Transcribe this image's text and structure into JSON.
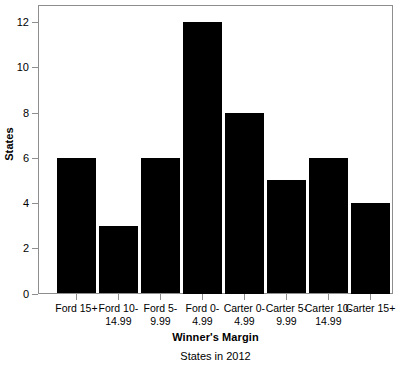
{
  "chart_data": {
    "type": "bar",
    "title": "",
    "subtitle": "States in 2012",
    "xlabel": "Winner's Margin",
    "ylabel": "States",
    "categories": [
      "Ford 15+",
      "Ford 10-14.99",
      "Ford 5-9.99",
      "Ford 0-4.99",
      "Carter 0-4.99",
      "Carter 5-9.99",
      "Carter 10-14.99",
      "Carter 15+"
    ],
    "category_lines": [
      [
        "Ford 15+"
      ],
      [
        "Ford 10-",
        "14.99"
      ],
      [
        "Ford 5-",
        "9.99"
      ],
      [
        "Ford 0-",
        "4.99"
      ],
      [
        "Carter 0-",
        "4.99"
      ],
      [
        "Carter 5-",
        "9.99"
      ],
      [
        "Carter 10-",
        "14.99"
      ],
      [
        "Carter 15+"
      ]
    ],
    "values": [
      6,
      3,
      6,
      12,
      8,
      5,
      6,
      4
    ],
    "ylim": [
      0,
      12.75
    ],
    "yticks": [
      0,
      2,
      4,
      6,
      8,
      10,
      12
    ],
    "ytick_labels": [
      "0",
      "2",
      "4",
      "6",
      "8",
      "10",
      "12"
    ],
    "grid": false,
    "legend": null,
    "bar_color": "#000000",
    "axis_color": "#8e8e8e",
    "background": "#ffffff"
  }
}
